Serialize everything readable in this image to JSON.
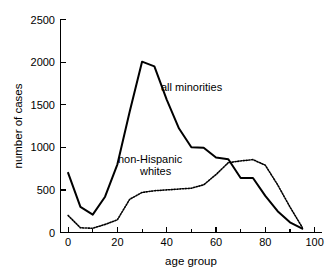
{
  "chart_data": {
    "type": "line",
    "title": "",
    "xlabel": "age group",
    "ylabel": "number of cases",
    "xlim": [
      -3,
      103
    ],
    "ylim": [
      0,
      2500
    ],
    "grid": false,
    "legend_position": "inline-annotation",
    "x_ticks_major": [
      0,
      20,
      40,
      60,
      80,
      100
    ],
    "x_ticks_minor": [
      10,
      30,
      50,
      70,
      90
    ],
    "y_ticks": [
      0,
      500,
      1000,
      1500,
      2000,
      2500
    ],
    "x_tick_labels": [
      "0",
      "20",
      "40",
      "60",
      "80",
      "100"
    ],
    "y_tick_labels": [
      "0",
      "500",
      "1000",
      "1500",
      "2000",
      "2500"
    ],
    "x": [
      0,
      5,
      10,
      15,
      20,
      25,
      30,
      35,
      40,
      45,
      50,
      55,
      60,
      65,
      70,
      75,
      80,
      85,
      90,
      95
    ],
    "series": [
      {
        "name": "all minorities",
        "style": "solid",
        "label_x": 48,
        "label_y": 1760,
        "values": [
          700,
          300,
          210,
          420,
          800,
          1420,
          2005,
          1950,
          1560,
          1220,
          1000,
          995,
          880,
          860,
          640,
          640,
          430,
          250,
          120,
          45
        ]
      },
      {
        "name": "non-Hispanic whites",
        "style": "dotted",
        "label_line1": "non-Hispanic",
        "label_line2": "whites",
        "label_x": 33,
        "label_y": 880,
        "values": [
          200,
          55,
          50,
          95,
          150,
          390,
          470,
          490,
          500,
          510,
          520,
          560,
          680,
          820,
          840,
          855,
          790,
          560,
          300,
          60
        ]
      }
    ]
  },
  "annotations": {
    "series1_label": "all minorities",
    "series2_label_line1": "non-Hispanic",
    "series2_label_line2": "whites"
  },
  "axes": {
    "x_axis_title": "age group",
    "y_axis_title": "number of cases"
  }
}
